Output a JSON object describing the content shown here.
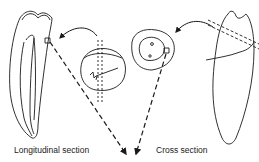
{
  "diagram": {
    "labels": {
      "longitudinal": "Longitudinal section",
      "cross": "Cross section"
    },
    "elements": [
      "longitudinal-tooth",
      "cross-tooth",
      "longitudinal-slice-disc",
      "cross-section-slice",
      "curved-arrow-left",
      "curved-arrow-right",
      "dashed-arrow-from-longitudinal",
      "dashed-arrow-from-cross"
    ],
    "colors": {
      "line": "#1a1a1a",
      "background": "#ffffff"
    }
  }
}
